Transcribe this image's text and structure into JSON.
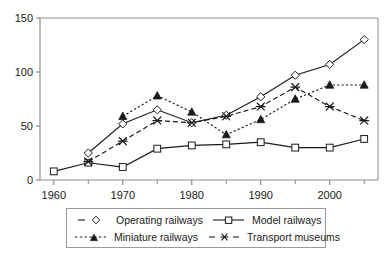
{
  "chart_data": {
    "type": "line",
    "title": "",
    "xlabel": "",
    "ylabel": "",
    "x": [
      1960,
      1965,
      1970,
      1975,
      1980,
      1985,
      1990,
      1995,
      2000,
      2005
    ],
    "xlim": [
      1958,
      2007
    ],
    "ylim": [
      0,
      150
    ],
    "xticks": [
      1960,
      1970,
      1980,
      1990,
      2000
    ],
    "xtick_labels": [
      "1960",
      "1970",
      "1980",
      "1990",
      "2000"
    ],
    "xminor_ticks": [
      1965,
      1975,
      1985,
      1995,
      2005
    ],
    "yticks": [
      0,
      50,
      100,
      150
    ],
    "ytick_labels": [
      "0",
      "50",
      "100",
      "150"
    ],
    "grid": false,
    "legend_position": "below",
    "series": [
      {
        "name": "Operating railways",
        "marker": "open-diamond",
        "line_style": "solid",
        "legend_line_style": "dashed",
        "color": "#1a1a1a",
        "points": [
          {
            "x": 1965,
            "y": 25
          },
          {
            "x": 1970,
            "y": 52
          },
          {
            "x": 1975,
            "y": 65
          },
          {
            "x": 1980,
            "y": 53
          },
          {
            "x": 1985,
            "y": 60
          },
          {
            "x": 1990,
            "y": 77
          },
          {
            "x": 1995,
            "y": 97
          },
          {
            "x": 2000,
            "y": 107
          },
          {
            "x": 2005,
            "y": 130
          }
        ]
      },
      {
        "name": "Model railways",
        "marker": "open-square",
        "line_style": "solid",
        "legend_line_style": "solid",
        "color": "#1a1a1a",
        "points": [
          {
            "x": 1960,
            "y": 8
          },
          {
            "x": 1965,
            "y": 16
          },
          {
            "x": 1970,
            "y": 12
          },
          {
            "x": 1975,
            "y": 29
          },
          {
            "x": 1980,
            "y": 32
          },
          {
            "x": 1985,
            "y": 33
          },
          {
            "x": 1990,
            "y": 35
          },
          {
            "x": 1995,
            "y": 30
          },
          {
            "x": 2000,
            "y": 30
          },
          {
            "x": 2005,
            "y": 38
          }
        ]
      },
      {
        "name": "Miniature railways",
        "marker": "filled-triangle",
        "line_style": "dotted",
        "legend_line_style": "dotted",
        "color": "#1a1a1a",
        "points": [
          {
            "x": 1970,
            "y": 59
          },
          {
            "x": 1975,
            "y": 78
          },
          {
            "x": 1980,
            "y": 63
          },
          {
            "x": 1985,
            "y": 42
          },
          {
            "x": 1990,
            "y": 56
          },
          {
            "x": 1995,
            "y": 75
          },
          {
            "x": 2000,
            "y": 88
          },
          {
            "x": 2005,
            "y": 88
          }
        ]
      },
      {
        "name": "Transport museums",
        "marker": "asterisk",
        "line_style": "dashed",
        "legend_line_style": "dashed",
        "color": "#1a1a1a",
        "points": [
          {
            "x": 1965,
            "y": 17
          },
          {
            "x": 1970,
            "y": 36
          },
          {
            "x": 1975,
            "y": 55
          },
          {
            "x": 1980,
            "y": 53
          },
          {
            "x": 1985,
            "y": 59
          },
          {
            "x": 1990,
            "y": 68
          },
          {
            "x": 1995,
            "y": 86
          },
          {
            "x": 2000,
            "y": 68
          },
          {
            "x": 2005,
            "y": 55
          }
        ]
      }
    ]
  },
  "legend": {
    "entries": [
      {
        "label": "Operating railways"
      },
      {
        "label": "Model railways"
      },
      {
        "label": "Miniature railways"
      },
      {
        "label": "Transport museums"
      }
    ]
  },
  "axes": {
    "y_labels": [
      "150",
      "100",
      "50",
      "0"
    ],
    "x_labels": [
      "1960",
      "1970",
      "1980",
      "1990",
      "2000"
    ]
  },
  "colors": {
    "ink": "#1a1a1a",
    "axis": "#8c8c8c",
    "background": "#ffffff"
  }
}
